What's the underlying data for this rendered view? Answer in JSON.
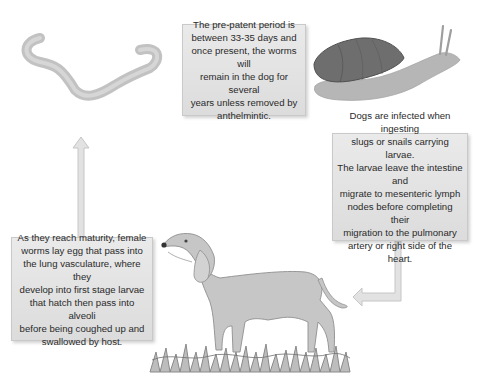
{
  "diagram": {
    "stages": [
      {
        "id": "adult-worm",
        "illustration": "worm-icon",
        "text": "The pre-patent period is\nbetween 33-35 days and\nonce present, the worms will\nremain in the dog for several\nyears unless removed by\nanthelmintic."
      },
      {
        "id": "snail-host",
        "illustration": "snail-icon",
        "text": "Dogs are infected when ingesting\nslugs or snails carrying larvae.\nThe larvae leave the intestine and\nmigrate to mesenteric lymph\nnodes before completing their\nmigration to the pulmonary\nartery or right side of the heart."
      },
      {
        "id": "dog-host",
        "illustration": "dog-icon",
        "text": "As they reach maturity, female\nworms lay egg that pass into\nthe lung vasculature, where they\ndevelop into first stage larvae\nthat hatch then pass into alveoli\nbefore being coughed up and\nswallowed by host."
      }
    ],
    "arrows": [
      {
        "from": "snail-host",
        "to": "dog-host",
        "direction": "down-then-left"
      },
      {
        "from": "dog-host",
        "to": "adult-worm",
        "direction": "up"
      }
    ],
    "colors": {
      "box_fill": "#e3e3e3",
      "box_border": "#c9c9c9",
      "text": "#2a2a2a",
      "worm": "#bdbdbd",
      "snail_shell": "#6e6e6e",
      "snail_body": "#b4b4b4",
      "dog": "#c4c4c4",
      "arrow": "#dcdcdc"
    }
  }
}
